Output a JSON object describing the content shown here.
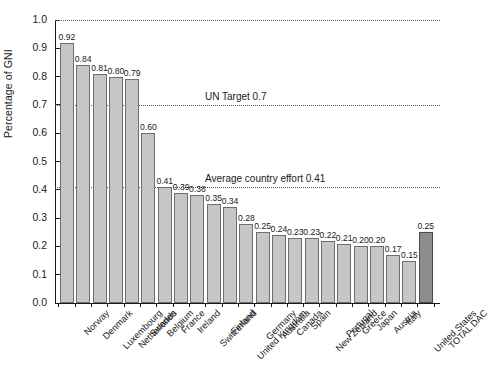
{
  "chart_data": {
    "type": "bar",
    "title": "",
    "xlabel": "",
    "ylabel": "Percentage of GNI",
    "ylim": [
      0.0,
      1.0
    ],
    "grid": "horizontal dotted reference lines at 1.0, 0.7 and 0.41",
    "legend": "none",
    "categories": [
      "Norway",
      "Denmark",
      "Luxembourg",
      "Netherlands",
      "Sweden",
      "Belgium",
      "France",
      "Ireland",
      "Switzerland",
      "Finland",
      "United Kingdom",
      "Germany",
      "Australia",
      "Canada",
      "Spain",
      "New Zealand",
      "Portugal",
      "Greece",
      "Japan",
      "Austria",
      "Italy",
      "United States",
      "TOTAL DAC"
    ],
    "values": [
      0.92,
      0.84,
      0.81,
      0.8,
      0.79,
      0.6,
      0.41,
      0.39,
      0.38,
      0.35,
      0.34,
      0.28,
      0.25,
      0.24,
      0.23,
      0.23,
      0.22,
      0.21,
      0.2,
      0.2,
      0.17,
      0.15,
      0.25
    ],
    "value_labels": [
      "0.92",
      "0.84",
      "0.81",
      "0.80",
      "0.79",
      "0.60",
      "0.41",
      "0.39",
      "0.38",
      "0.35",
      "0.34",
      "0.28",
      "0.25",
      "0.24",
      "0.23",
      "0.23",
      "0.22",
      "0.21",
      "0.20",
      "0.20",
      "0.17",
      "0.15",
      "0.25"
    ],
    "highlight_index": 22,
    "ytick_labels": [
      "1.0",
      "0.9",
      "0.8",
      "0.7",
      "0.6",
      "0.5",
      "0.4",
      "0.3",
      "0.2",
      "0.1",
      "0.0"
    ],
    "ytick_values": [
      1.0,
      0.9,
      0.8,
      0.7,
      0.6,
      0.5,
      0.4,
      0.3,
      0.2,
      0.1,
      0.0
    ],
    "reference_lines": [
      {
        "value": 1.0,
        "label": ""
      },
      {
        "value": 0.7,
        "label": "UN Target 0.7"
      },
      {
        "value": 0.41,
        "label": "Average country effort 0.41"
      }
    ],
    "colors": {
      "bar_fill": "#c6c6c6",
      "bar_edge": "#6e6e6e",
      "highlight_fill": "#8d8d8d",
      "highlight_edge": "#4a4a4a",
      "axis": "#1a1a1a",
      "gridline": "#555555"
    }
  },
  "footer": {
    "cropped_text": ""
  }
}
